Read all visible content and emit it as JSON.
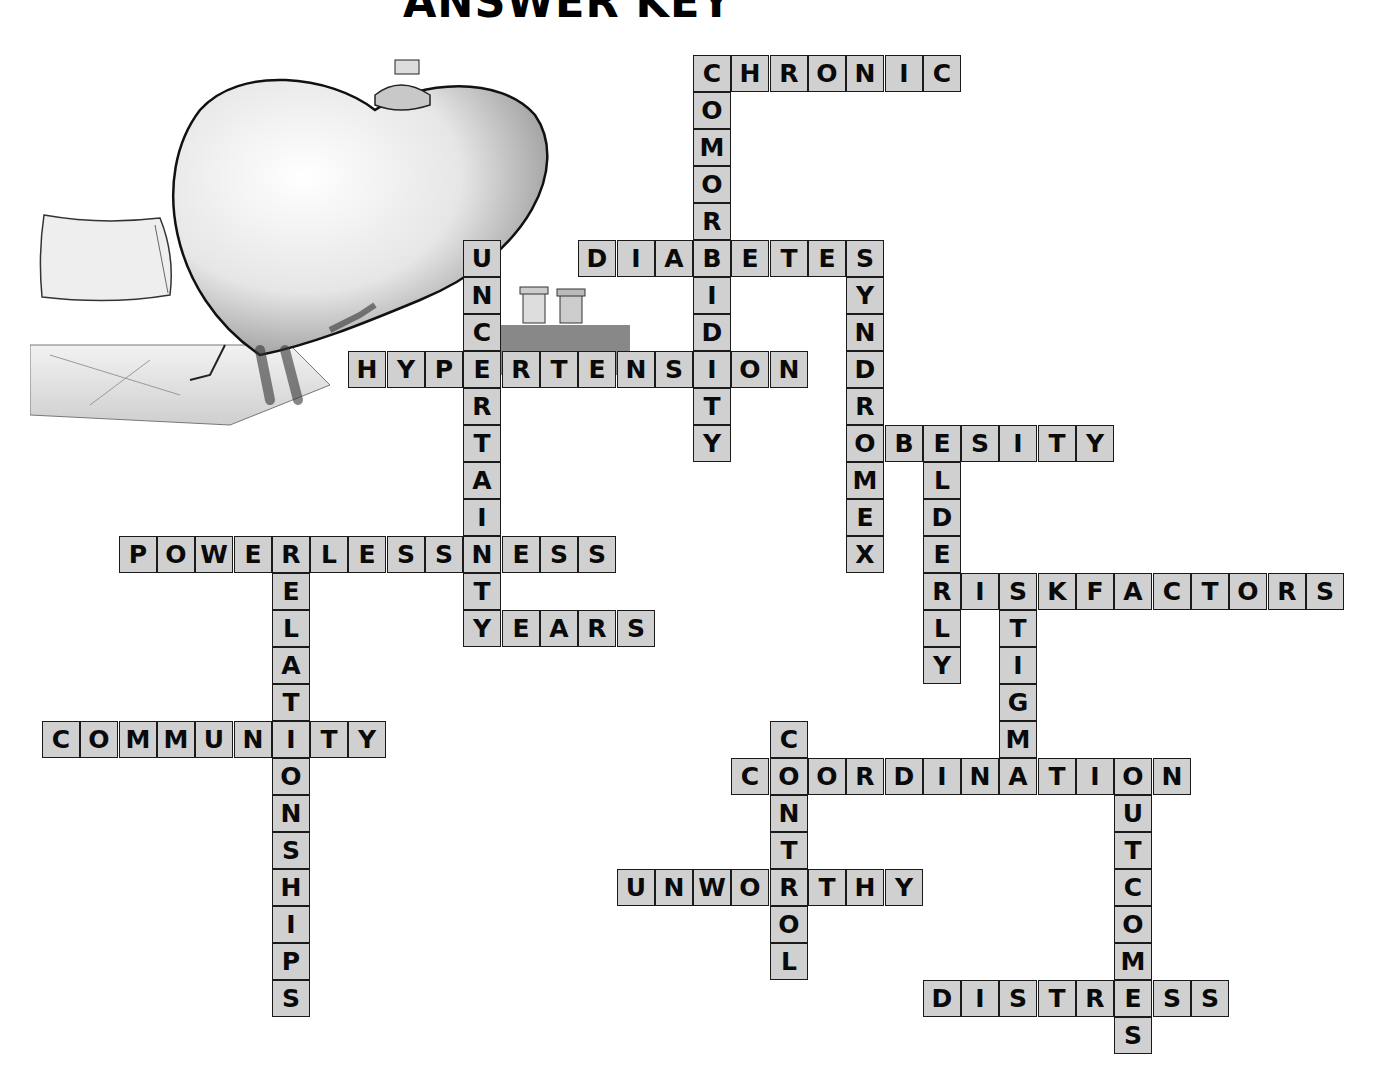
{
  "title": "ANSWER KEY",
  "grid": {
    "origin_x": 42,
    "origin_y": 55,
    "col_pitch": 38.3,
    "row_pitch": 37,
    "cell_fill": "#d0d0d0",
    "cell_border": "#1a1a1a"
  },
  "illustration": {
    "description": "sketch of a sick heart character wearing pajamas sitting on a bed with an ice bag on its head, pillow and pill bottles nearby"
  },
  "words": [
    {
      "word": "CHRONIC",
      "dir": "across",
      "col": 17,
      "row": 0
    },
    {
      "word": "COMORBIDITY",
      "dir": "down",
      "col": 17,
      "row": 0
    },
    {
      "word": "DIABETES",
      "dir": "across",
      "col": 14,
      "row": 5
    },
    {
      "word": "UNCERTAINTY",
      "dir": "down",
      "col": 11,
      "row": 5
    },
    {
      "word": "SYNDROMEX",
      "dir": "down",
      "col": 21,
      "row": 5
    },
    {
      "word": "HYPERTENSION",
      "dir": "across",
      "col": 8,
      "row": 8
    },
    {
      "word": "OBESITY",
      "dir": "across",
      "col": 21,
      "row": 10
    },
    {
      "word": "ELDERLY",
      "dir": "down",
      "col": 23,
      "row": 10
    },
    {
      "word": "POWERLESSNESS",
      "dir": "across",
      "col": 2,
      "row": 13
    },
    {
      "word": "RELATIONSHIPS",
      "dir": "down",
      "col": 6,
      "row": 13
    },
    {
      "word": "RISKFACTORS",
      "dir": "across",
      "col": 23,
      "row": 14
    },
    {
      "word": "STIGMA",
      "dir": "down",
      "col": 25,
      "row": 14
    },
    {
      "word": "YEARS",
      "dir": "across",
      "col": 11,
      "row": 15
    },
    {
      "word": "COMMUNITY",
      "dir": "across",
      "col": 0,
      "row": 18
    },
    {
      "word": "CONTROL",
      "dir": "down",
      "col": 19,
      "row": 18
    },
    {
      "word": "COORDINATION",
      "dir": "across",
      "col": 18,
      "row": 19
    },
    {
      "word": "OUTCOMES",
      "dir": "down",
      "col": 28,
      "row": 19
    },
    {
      "word": "UNWORTHY",
      "dir": "across",
      "col": 15,
      "row": 22
    },
    {
      "word": "DISTRESS",
      "dir": "across",
      "col": 23,
      "row": 25
    }
  ]
}
